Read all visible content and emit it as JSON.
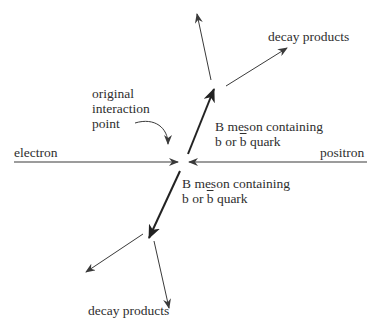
{
  "diagram": {
    "labels": {
      "electron": "electron",
      "positron": "positron",
      "interaction_point": [
        "original",
        "interaction",
        "point"
      ],
      "b_meson_upper": {
        "line1": "B meson containing",
        "line2_prefix": "b or ",
        "line2_bar": "b",
        "line2_suffix": " quark"
      },
      "b_meson_lower": {
        "line1": "B meson containing",
        "line2_prefix": "b or ",
        "line2_bar": "b",
        "line2_suffix": " quark"
      },
      "decay_upper": "decay products",
      "decay_lower": "decay products"
    },
    "colors": {
      "line": "#3a3a3a",
      "thick_line": "#2a2a2a",
      "text": "#2e2e2e",
      "background": "#ffffff"
    }
  }
}
